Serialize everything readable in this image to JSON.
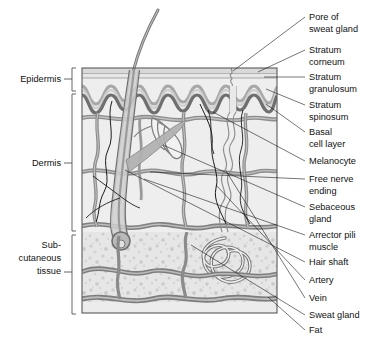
{
  "figure": {
    "type": "anatomical-diagram",
    "colors": {
      "epidermis_fill": "#e8e8e8",
      "dermis_fill": "#ececec",
      "subcutaneous_fill": "#e4e4e4",
      "vessel_dark": "#6e6e6e",
      "vessel_mid": "#9a9a9a",
      "vessel_light": "#c9c9c9",
      "outline": "#4a4a4a",
      "text": "#111111",
      "bracket": "#555555"
    }
  },
  "left_labels": [
    {
      "id": "epidermis",
      "text": "Epidermis",
      "lines": [
        "Epidermis"
      ],
      "x": 62,
      "y": 79
    },
    {
      "id": "dermis",
      "text": "Dermis",
      "lines": [
        "Dermis"
      ],
      "x": 62,
      "y": 163
    },
    {
      "id": "subcutaneous-tissue",
      "text": "Sub-cutaneous tissue",
      "lines": [
        "Sub-",
        "cutaneous",
        "tissue"
      ],
      "x": 62,
      "y": 250
    }
  ],
  "right_labels": [
    {
      "id": "pore-of-sweat-gland",
      "lines": [
        "Pore of",
        "sweat gland"
      ],
      "x": 309,
      "y": 20,
      "tip_x": 305,
      "tip_y": 17,
      "anchor_x": 233,
      "anchor_y": 71
    },
    {
      "id": "stratum-corneum",
      "lines": [
        "Stratum",
        "corneum"
      ],
      "x": 309,
      "y": 53,
      "tip_x": 305,
      "tip_y": 50,
      "anchor_x": 258,
      "anchor_y": 73
    },
    {
      "id": "stratum-granulosum",
      "lines": [
        "Stratum",
        "granulosum"
      ],
      "x": 309,
      "y": 80,
      "tip_x": 305,
      "tip_y": 77,
      "anchor_x": 264,
      "anchor_y": 78
    },
    {
      "id": "stratum-spinosum",
      "lines": [
        "Stratum",
        "spinosum"
      ],
      "x": 309,
      "y": 108,
      "tip_x": 305,
      "tip_y": 105,
      "anchor_x": 266,
      "anchor_y": 89
    },
    {
      "id": "basal-cell-layer",
      "lines": [
        "Basal",
        "cell layer"
      ],
      "x": 309,
      "y": 135,
      "tip_x": 305,
      "tip_y": 132,
      "anchor_x": 266,
      "anchor_y": 104
    },
    {
      "id": "melanocyte",
      "lines": [
        "Melanocyte"
      ],
      "x": 309,
      "y": 164,
      "tip_x": 305,
      "tip_y": 161,
      "anchor_x": 213,
      "anchor_y": 112
    },
    {
      "id": "free-nerve-ending",
      "lines": [
        "Free nerve",
        "ending"
      ],
      "x": 309,
      "y": 182,
      "tip_x": 305,
      "tip_y": 179,
      "anchor_x": 150,
      "anchor_y": 172
    },
    {
      "id": "sebaceous-gland",
      "lines": [
        "Sebaceous",
        "gland"
      ],
      "x": 309,
      "y": 210,
      "tip_x": 305,
      "tip_y": 207,
      "anchor_x": 163,
      "anchor_y": 145
    },
    {
      "id": "arrector-pili-muscle",
      "lines": [
        "Arrector pili",
        "muscle"
      ],
      "x": 309,
      "y": 238,
      "tip_x": 305,
      "tip_y": 235,
      "anchor_x": 144,
      "anchor_y": 179
    },
    {
      "id": "hair-shaft",
      "lines": [
        "Hair shaft"
      ],
      "x": 309,
      "y": 265,
      "tip_x": 305,
      "tip_y": 262,
      "anchor_x": 125,
      "anchor_y": 170
    },
    {
      "id": "artery",
      "lines": [
        "Artery"
      ],
      "x": 309,
      "y": 283,
      "tip_x": 305,
      "tip_y": 280,
      "anchor_x": 216,
      "anchor_y": 185
    },
    {
      "id": "vein",
      "lines": [
        "Vein"
      ],
      "x": 309,
      "y": 301,
      "tip_x": 305,
      "tip_y": 298,
      "anchor_x": 226,
      "anchor_y": 171
    },
    {
      "id": "sweat-gland",
      "lines": [
        "Sweat gland"
      ],
      "x": 309,
      "y": 318,
      "tip_x": 305,
      "tip_y": 315,
      "anchor_x": 191,
      "anchor_y": 245
    },
    {
      "id": "fat",
      "lines": [
        "Fat"
      ],
      "x": 309,
      "y": 333,
      "tip_x": 305,
      "tip_y": 330,
      "anchor_x": 268,
      "anchor_y": 297
    }
  ],
  "brackets": [
    {
      "id": "bracket-epidermis",
      "top": 68,
      "bottom": 91,
      "x": 73,
      "tick_y": 79
    },
    {
      "id": "bracket-dermis",
      "top": 94,
      "bottom": 231,
      "x": 73,
      "tick_y": 163
    },
    {
      "id": "bracket-subcutaneous",
      "top": 235,
      "bottom": 314,
      "x": 73,
      "tick_y": 272
    }
  ],
  "diagram_box": {
    "x": 82,
    "y": 68,
    "width": 195,
    "height": 245
  },
  "layer_bands": [
    {
      "id": "stratum-corneum-band",
      "y": 68,
      "height": 6
    },
    {
      "id": "epidermis-band",
      "y": 74,
      "height": 18
    },
    {
      "id": "dermis-band",
      "y": 92,
      "height": 140
    },
    {
      "id": "subcutaneous-band",
      "y": 232,
      "height": 81
    }
  ]
}
